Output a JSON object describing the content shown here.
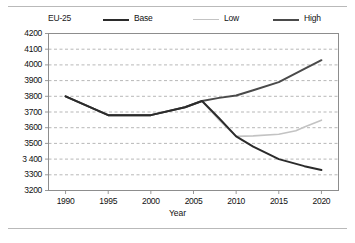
{
  "figure": {
    "group_label": "EU-25",
    "xlabel": "Year"
  },
  "chart_data": {
    "type": "line",
    "title": "",
    "subtitle": "",
    "group_label": "EU-25",
    "xlabel": "Year",
    "ylabel": "",
    "xlim": [
      1988,
      2022
    ],
    "ylim": [
      3200,
      4200
    ],
    "ytick_step": 100,
    "grid": true,
    "grid_style": "dashed-horizontal",
    "legend_position": "top",
    "yticks": [
      "4200",
      "4100",
      "4000",
      "3900",
      "3800",
      "3700",
      "3600",
      "3500",
      "3 400",
      "3300",
      "3200"
    ],
    "ytick_values": [
      4200,
      4100,
      4000,
      3900,
      3800,
      3700,
      3600,
      3500,
      3400,
      3300,
      3200
    ],
    "xticks": [
      "1990",
      "1995",
      "2000",
      "2005",
      "2010",
      "2015",
      "2020"
    ],
    "xtick_values": [
      1990,
      1995,
      2000,
      2005,
      2010,
      2015,
      2020
    ],
    "series": [
      {
        "name": "Base",
        "color": "#2b2b2b",
        "width": 2.0,
        "x": [
          1990,
          1995,
          2000,
          2004,
          2006,
          2008,
          2010,
          2012,
          2015,
          2018,
          2020
        ],
        "values": [
          3800,
          3680,
          3680,
          3730,
          3770,
          3660,
          3545,
          3480,
          3400,
          3355,
          3330
        ]
      },
      {
        "name": "Low",
        "color": "#c3c3c3",
        "width": 1.6,
        "x": [
          2006,
          2008,
          2010,
          2012,
          2015,
          2017,
          2018,
          2020
        ],
        "values": [
          3770,
          3650,
          3545,
          3548,
          3558,
          3580,
          3605,
          3648
        ]
      },
      {
        "name": "High",
        "color": "#4a4a4a",
        "width": 2.0,
        "x": [
          1990,
          1995,
          2000,
          2004,
          2006,
          2008,
          2010,
          2012,
          2015,
          2018,
          2020
        ],
        "values": [
          3800,
          3680,
          3680,
          3730,
          3770,
          3790,
          3805,
          3838,
          3890,
          3975,
          4030
        ]
      }
    ],
    "annotations": []
  }
}
